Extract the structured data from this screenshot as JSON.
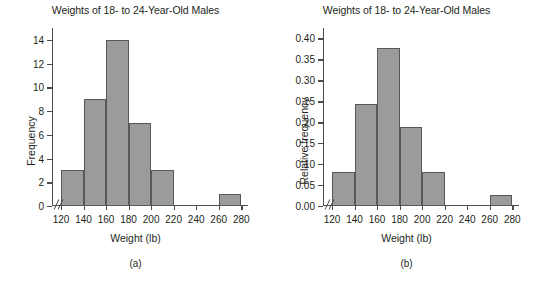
{
  "figure": {
    "panels": [
      {
        "caption": "(a)",
        "chart_data": {
          "type": "bar",
          "title": "Weights of 18- to 24-Year-Old Males",
          "xlabel": "Weight (lb)",
          "ylabel": "Frequency",
          "categories": [
            "120-140",
            "140-160",
            "160-180",
            "180-200",
            "200-220",
            "220-240",
            "240-260",
            "260-280"
          ],
          "bin_edges": [
            120,
            140,
            160,
            180,
            200,
            220,
            240,
            260,
            280
          ],
          "values": [
            3,
            9,
            14,
            7,
            3,
            0,
            0,
            1
          ],
          "xticks": [
            120,
            140,
            160,
            180,
            200,
            220,
            240,
            260,
            280
          ],
          "xtick_labels": [
            "120",
            "140",
            "160",
            "180",
            "200",
            "220",
            "240",
            "260",
            "280"
          ],
          "yticks": [
            0,
            2,
            4,
            6,
            8,
            10,
            12,
            14
          ],
          "ytick_labels": [
            "0",
            "2",
            "4",
            "6",
            "8",
            "10",
            "12",
            "14"
          ],
          "xlim": [
            100,
            280
          ],
          "ylim": [
            0,
            15
          ],
          "grid": false,
          "axis_break": true,
          "bar_color": "#9b9b9b",
          "bar_edge_color": "#58585a"
        }
      },
      {
        "caption": "(b)",
        "chart_data": {
          "type": "bar",
          "title": "Weights of 18- to 24-Year-Old Males",
          "xlabel": "Weight (lb)",
          "ylabel": "Relative frequency",
          "categories": [
            "120-140",
            "140-160",
            "160-180",
            "180-200",
            "200-220",
            "220-240",
            "240-260",
            "260-280"
          ],
          "bin_edges": [
            120,
            140,
            160,
            180,
            200,
            220,
            240,
            260,
            280
          ],
          "values": [
            0.081,
            0.243,
            0.378,
            0.189,
            0.081,
            0.0,
            0.0,
            0.027
          ],
          "xticks": [
            120,
            140,
            160,
            180,
            200,
            220,
            240,
            260,
            280
          ],
          "xtick_labels": [
            "120",
            "140",
            "160",
            "180",
            "200",
            "220",
            "240",
            "260",
            "280"
          ],
          "yticks": [
            0.0,
            0.05,
            0.1,
            0.15,
            0.2,
            0.25,
            0.3,
            0.35,
            0.4
          ],
          "ytick_labels": [
            "0.00",
            "0.05",
            "0.10",
            "0.15",
            "0.20",
            "0.25",
            "0.30",
            "0.35",
            "0.40"
          ],
          "xlim": [
            100,
            280
          ],
          "ylim": [
            0,
            0.425
          ],
          "grid": false,
          "axis_break": true,
          "bar_color": "#9b9b9b",
          "bar_edge_color": "#58585a"
        }
      }
    ]
  }
}
